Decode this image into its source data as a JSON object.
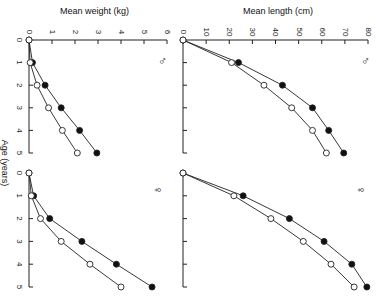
{
  "chart_data": [
    {
      "type": "line",
      "panel": "male-weight",
      "sex_symbol": "♂",
      "xlabel": "Age (years)",
      "ylabel": "Mean weight (kg)",
      "x": [
        0,
        1,
        2,
        3,
        4,
        5
      ],
      "ylim": [
        0,
        6
      ],
      "yticks": [
        "0",
        "1",
        "2",
        "3",
        "4",
        "5",
        "6"
      ],
      "series": [
        {
          "name": "filled",
          "marker": "filled-circle",
          "values": [
            0,
            0.15,
            0.7,
            1.4,
            2.2,
            2.95
          ]
        },
        {
          "name": "open",
          "marker": "open-circle",
          "values": [
            0,
            0.05,
            0.35,
            0.85,
            1.45,
            2.1
          ]
        }
      ]
    },
    {
      "type": "line",
      "panel": "male-length",
      "sex_symbol": "♂",
      "xlabel": "Age (years)",
      "ylabel": "Mean length (cm)",
      "x": [
        0,
        1,
        2,
        3,
        4,
        5
      ],
      "ylim": [
        0,
        80
      ],
      "yticks": [
        "0",
        "10",
        "20",
        "30",
        "40",
        "50",
        "60",
        "70",
        "80"
      ],
      "series": [
        {
          "name": "filled",
          "marker": "filled-circle",
          "values": [
            0,
            24,
            43,
            56,
            63,
            69.5
          ]
        },
        {
          "name": "open",
          "marker": "open-circle",
          "values": [
            0,
            21,
            35,
            47,
            56,
            62
          ]
        }
      ]
    },
    {
      "type": "line",
      "panel": "female-weight",
      "sex_symbol": "♀",
      "xlabel": "Age (years)",
      "ylabel": "Mean weight (kg)",
      "x": [
        0,
        1,
        2,
        3,
        4,
        5
      ],
      "ylim": [
        0,
        6
      ],
      "series": [
        {
          "name": "filled",
          "marker": "filled-circle",
          "values": [
            0,
            0.2,
            0.9,
            2.3,
            3.8,
            5.35
          ]
        },
        {
          "name": "open",
          "marker": "open-circle",
          "values": [
            0,
            0.1,
            0.5,
            1.4,
            2.65,
            4.0
          ]
        }
      ]
    },
    {
      "type": "line",
      "panel": "female-length",
      "sex_symbol": "♀",
      "xlabel": "Age (years)",
      "ylabel": "Mean length (cm)",
      "x": [
        0,
        1,
        2,
        3,
        4,
        5
      ],
      "ylim": [
        0,
        80
      ],
      "series": [
        {
          "name": "filled",
          "marker": "filled-circle",
          "values": [
            0,
            26,
            46,
            61,
            73,
            79.5
          ]
        },
        {
          "name": "open",
          "marker": "open-circle",
          "values": [
            0,
            22,
            38,
            52,
            64,
            74
          ]
        }
      ]
    }
  ],
  "labels": {
    "weight_axis": "Mean weight (kg)",
    "length_axis": "Mean length (cm)",
    "age_axis": "Age (years)",
    "male": "♂",
    "female": "♀",
    "age_ticks": [
      "0",
      "1",
      "2",
      "3",
      "4",
      "5"
    ]
  }
}
